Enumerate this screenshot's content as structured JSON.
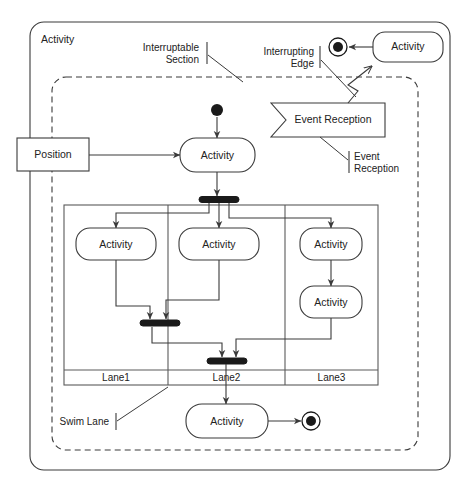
{
  "diagram": {
    "type": "uml-activity-diagram",
    "outer_frame_label": "Activity",
    "background_color": "#ffffff",
    "line_color": "#3a3a3a",
    "bar_color": "#1a1a1a"
  },
  "annotations": [
    {
      "id": "interruptable-section",
      "line1": "Interruptable",
      "line2": "Section",
      "align": "right"
    },
    {
      "id": "interrupting-edge",
      "line1": "Interrupting",
      "line2": "Edge",
      "align": "right"
    },
    {
      "id": "event-reception-note",
      "line1": "Event",
      "line2": "Reception",
      "align": "left"
    },
    {
      "id": "swim-lane-note",
      "line1": "Swim Lane",
      "line2": "",
      "align": "right"
    }
  ],
  "nodes": {
    "object_node": {
      "label": "Position",
      "shape": "rectangle"
    },
    "activity_main": {
      "label": "Activity",
      "shape": "rounded-rectangle"
    },
    "activity_lane1": {
      "label": "Activity",
      "shape": "rounded-rectangle"
    },
    "activity_lane2": {
      "label": "Activity",
      "shape": "rounded-rectangle"
    },
    "activity_lane3_top": {
      "label": "Activity",
      "shape": "rounded-rectangle"
    },
    "activity_lane3_bottom": {
      "label": "Activity",
      "shape": "rounded-rectangle"
    },
    "activity_final_flow": {
      "label": "Activity",
      "shape": "rounded-rectangle"
    },
    "activity_interrupt": {
      "label": "Activity",
      "shape": "rounded-rectangle"
    },
    "event_reception": {
      "label": "Event Reception",
      "shape": "pentagon-notched"
    },
    "initial_node": {
      "label": "",
      "shape": "filled-circle"
    },
    "final_node_bottom": {
      "label": "",
      "shape": "final-node"
    },
    "final_node_interrupt": {
      "label": "",
      "shape": "final-node"
    }
  },
  "lanes": [
    {
      "label": "Lane1"
    },
    {
      "label": "Lane2"
    },
    {
      "label": "Lane3"
    }
  ],
  "control_nodes": [
    {
      "id": "fork-bar-top",
      "kind": "fork"
    },
    {
      "id": "join-bar-left",
      "kind": "join"
    },
    {
      "id": "join-bar-center",
      "kind": "join"
    }
  ]
}
